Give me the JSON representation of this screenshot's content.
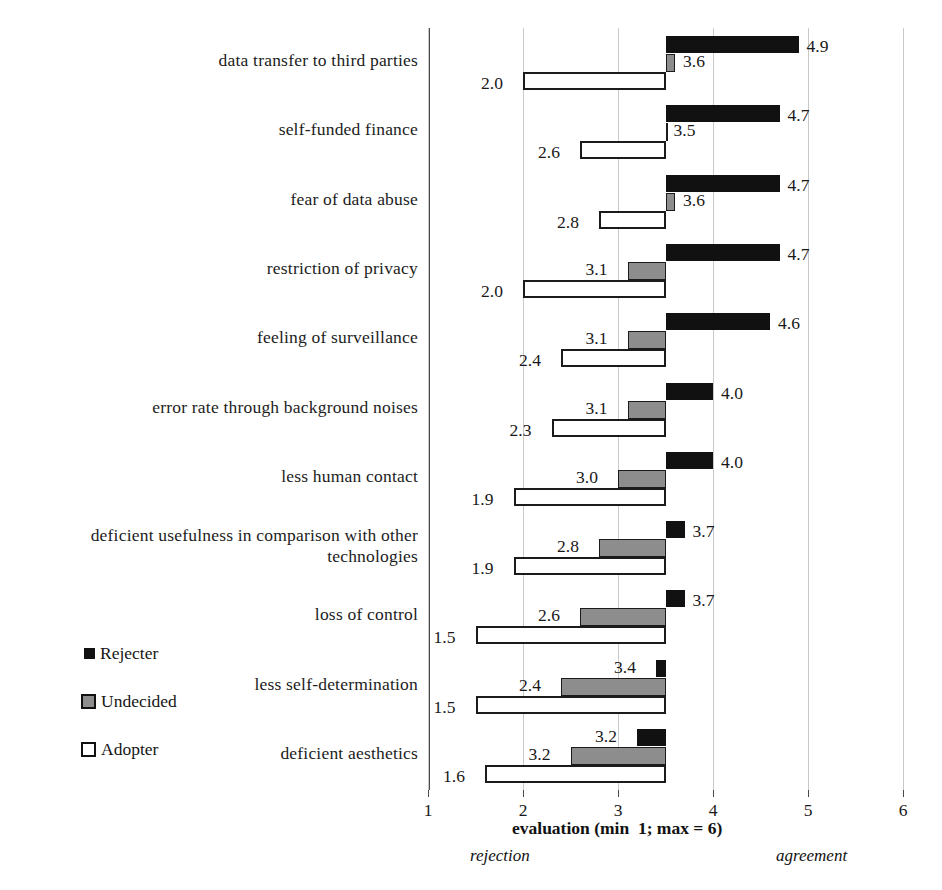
{
  "chart_data": {
    "type": "bar",
    "orientation": "horizontal",
    "title": "",
    "xlabel": "evaluation (min  1; max = 6)",
    "ylabel": "",
    "xlim": [
      1,
      6
    ],
    "xticks": [
      1,
      2,
      3,
      4,
      5,
      6
    ],
    "baseline": 3.5,
    "grid": true,
    "legend_position": "left-lower",
    "annotations": {
      "low_end": "rejection",
      "high_end": "agreement"
    },
    "series": [
      {
        "name": "Rejecter",
        "color": "#111111",
        "values": [
          4.9,
          4.7,
          4.7,
          4.7,
          4.6,
          4.0,
          4.0,
          3.7,
          3.7,
          3.4,
          3.2
        ]
      },
      {
        "name": "Undecided",
        "color": "#8d8d8d",
        "values": [
          3.6,
          3.5,
          3.6,
          3.1,
          3.1,
          3.1,
          3.0,
          2.8,
          2.6,
          2.4,
          2.5
        ]
      },
      {
        "name": "Adopter",
        "color": "#ffffff",
        "values": [
          2.0,
          2.6,
          2.8,
          2.0,
          2.4,
          2.3,
          1.9,
          1.9,
          1.5,
          1.5,
          1.6
        ]
      }
    ],
    "categories": [
      "data transfer to third parties",
      "self-funded finance",
      "fear of data abuse",
      "restriction of privacy",
      "feeling of surveillance",
      "error rate through background noises",
      "less human contact",
      "deficient usefulness in comparison with other technologies",
      "loss of control",
      "less self-determination",
      "deficient aesthetics"
    ],
    "data_labels": {
      "Rejecter": [
        "4.9",
        "4.7",
        "4.7",
        "4.7",
        "4.6",
        "4.0",
        "4.0",
        "3.7",
        "3.7",
        "3.4",
        "3.2"
      ],
      "Undecided": [
        "3.6",
        "3.5",
        "3.6",
        "3.1",
        "3.1",
        "3.1",
        "3.0",
        "2.8",
        "2.6",
        "2.4",
        "3.2"
      ],
      "Adopter": [
        "2.0",
        "2.6",
        "2.8",
        "2.0",
        "2.4",
        "2.3",
        "1.9",
        "1.9",
        "1.5",
        "1.5",
        "1.6"
      ]
    }
  },
  "legend": {
    "items": [
      {
        "label": "Rejecter",
        "swatch": "filled-black-square"
      },
      {
        "label": "Undecided",
        "swatch": "filled-gray-square"
      },
      {
        "label": "Adopter",
        "swatch": "outlined-white-square"
      }
    ]
  },
  "xaxis": {
    "ticks": [
      "1",
      "2",
      "3",
      "4",
      "5",
      "6"
    ],
    "title": "evaluation (min  1; max = 6)",
    "left_note": "rejection",
    "right_note": "agreement"
  }
}
